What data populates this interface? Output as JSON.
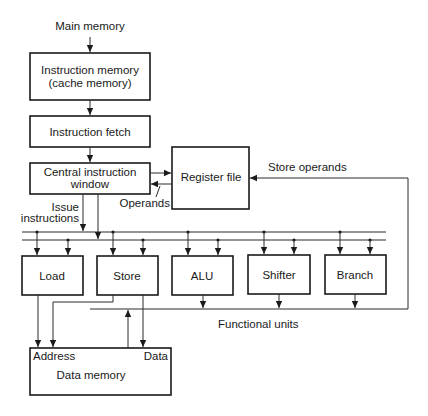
{
  "diagram": {
    "input_label": "Main memory",
    "instruction_memory": {
      "line1": "Instruction memory",
      "line2": "(cache memory)"
    },
    "instruction_fetch": "Instruction fetch",
    "central_window": {
      "line1": "Central instruction",
      "line2": "window"
    },
    "register_file": "Register file",
    "operands_label": "Operands",
    "store_operands_label": "Store operands",
    "issue_label": {
      "line1": "Issue",
      "line2": "instructions"
    },
    "functional_units": [
      {
        "id": "load",
        "label": "Load"
      },
      {
        "id": "store",
        "label": "Store"
      },
      {
        "id": "alu",
        "label": "ALU"
      },
      {
        "id": "shifter",
        "label": "Shifter"
      },
      {
        "id": "branch",
        "label": "Branch"
      }
    ],
    "functional_units_label": "Functional units",
    "data_memory": {
      "label": "Data memory",
      "address_port": "Address",
      "data_port": "Data"
    }
  }
}
